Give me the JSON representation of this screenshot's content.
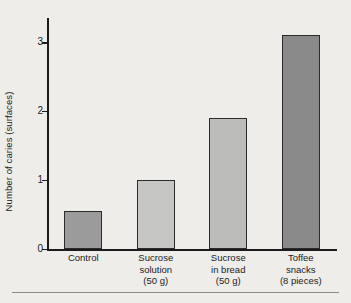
{
  "chart_data": {
    "type": "bar",
    "title": "",
    "subtitle": "",
    "xlabel": "",
    "ylabel": "Number of caries (surfaces)",
    "categories": [
      "Control",
      "Sucrose solution (50 g)",
      "Sucrose in bread (50 g)",
      "Toffee snacks (8 pieces)"
    ],
    "category_lines": [
      [
        "Control"
      ],
      [
        "Sucrose",
        "solution",
        "(50 g)"
      ],
      [
        "Sucrose",
        "in bread",
        "(50 g)"
      ],
      [
        "Toffee",
        "snacks",
        "(8 pieces)"
      ]
    ],
    "values": [
      0.55,
      1.0,
      1.9,
      3.1
    ],
    "bar_colors": [
      "#9b9b9b",
      "#c6c6c4",
      "#bcbcba",
      "#8a8a8a"
    ],
    "bar_edge_color": "#2b2b2b",
    "ylim": [
      0,
      3.35
    ],
    "yticks": [
      0,
      1,
      2,
      3
    ],
    "ytick_labels": [
      "0",
      "1",
      "2",
      "3"
    ],
    "grid": false,
    "legend": null,
    "axis_color": "#1b1b1b",
    "background_color": "#eeedea"
  }
}
